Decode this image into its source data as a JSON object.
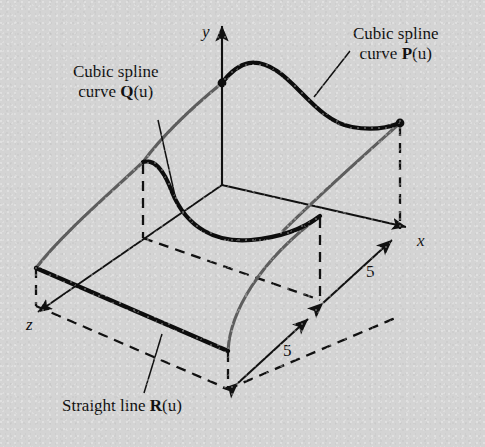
{
  "figure": {
    "type": "technical-diagram",
    "background_color": "#d4d4d4",
    "ink_color": "#111111",
    "rail_color": "#5e5e5e"
  },
  "axes": {
    "y_label": "y",
    "x_label": "x",
    "z_label": "z",
    "origin_px": [
      222,
      185
    ]
  },
  "labels": {
    "p_curve": {
      "line1": "Cubic spline",
      "line2_prefix": "curve ",
      "line2_bold": "P",
      "line2_suffix": "(u)"
    },
    "q_curve": {
      "line1": "Cubic spline",
      "line2_prefix": "curve ",
      "line2_bold": "Q",
      "line2_suffix": "(u)"
    },
    "r_line": {
      "prefix": "Straight line ",
      "bold": "R",
      "suffix": "(u)"
    }
  },
  "dimensions": [
    {
      "name": "x-extent",
      "value": "5"
    },
    {
      "name": "z-extent",
      "value": "5"
    }
  ],
  "geometry": {
    "p_curve_points": "M222,83 C243,58 258,60 278,72 C300,85 322,122 352,127 C374,130 390,127 400,123",
    "q_curve_points": "M143,162 C155,160 163,168 172,192 C186,228 216,243 250,240 C284,237 306,226 320,216",
    "rail_left": "M36,268 C60,236 105,198 143,162",
    "rail_mid": "M228,350 C232,312 260,262 320,216",
    "rail_right": "M400,123 C370,150 318,196 282,232",
    "rail_front": "M222,83 C200,100 168,126 143,162",
    "r_line": "M36,268 L228,350"
  }
}
